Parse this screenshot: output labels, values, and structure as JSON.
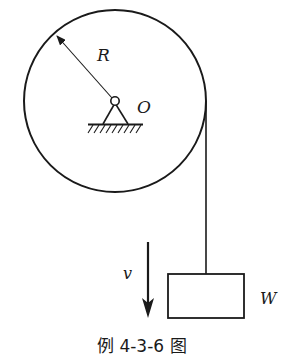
{
  "diagram": {
    "type": "pulley-mechanics",
    "labels": {
      "radius": "R",
      "center": "O",
      "velocity": "v",
      "weight": "W"
    },
    "caption": "例 4-3-6 图",
    "colors": {
      "stroke": "#1a1a1a",
      "background": "#ffffff"
    },
    "elements": [
      {
        "name": "pulley-disk",
        "shape": "circle",
        "center": [
          115,
          101
        ],
        "radius": 91
      },
      {
        "name": "radius-arrow",
        "from": [
          112,
          99
        ],
        "to": [
          55,
          34
        ]
      },
      {
        "name": "pin-joint",
        "center": [
          115,
          102
        ],
        "radius": 4
      },
      {
        "name": "fixed-support",
        "base_y": 124
      },
      {
        "name": "rope",
        "x": 206,
        "y_from": 101,
        "y_to": 274
      },
      {
        "name": "weight-block",
        "x": 168,
        "y": 274,
        "width": 76,
        "height": 44
      },
      {
        "name": "velocity-arrow",
        "x": 148,
        "y_from": 242,
        "y_to": 317,
        "direction": "down"
      }
    ]
  }
}
